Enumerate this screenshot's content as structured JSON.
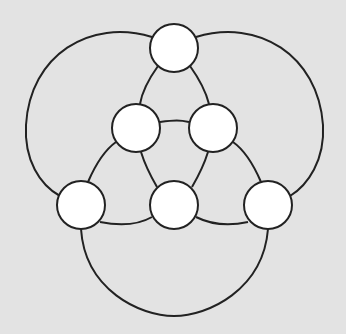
{
  "diagram": {
    "type": "graph",
    "background": "#e3e3e3",
    "stroke_color": "#222222",
    "node_fill": "#ffffff",
    "node_radius": 24,
    "nodes": [
      {
        "id": "top",
        "cx": 174,
        "cy": 48
      },
      {
        "id": "inner-left",
        "cx": 136,
        "cy": 128
      },
      {
        "id": "inner-right",
        "cx": 213,
        "cy": 128
      },
      {
        "id": "bottom-left",
        "cx": 81,
        "cy": 205
      },
      {
        "id": "bottom-middle",
        "cx": 174,
        "cy": 205
      },
      {
        "id": "bottom-right",
        "cx": 268,
        "cy": 205
      }
    ],
    "edges": [
      {
        "id": "outer-left",
        "d": "M 152 37 C 90 18, 30 55, 26 125 C 24 160, 40 185, 60 196"
      },
      {
        "id": "outer-right",
        "d": "M 196 37 C 258 18, 318 55, 323 125 C 325 160, 308 185, 290 196"
      },
      {
        "id": "outer-bottom",
        "d": "M 81 229 C 85 290, 140 316, 174 316 C 208 316, 263 290, 268 229"
      },
      {
        "id": "top-innerleft",
        "d": "M 158 66 C 148 80, 142 92, 140 104"
      },
      {
        "id": "top-innerright",
        "d": "M 190 66 C 200 80, 206 92, 209 104"
      },
      {
        "id": "innerleft-innerright",
        "d": "M 160 122 C 175 120, 180 120, 189 122"
      },
      {
        "id": "innerleft-bottomleft",
        "d": "M 116 142 C 102 152, 94 168, 88 182"
      },
      {
        "id": "innerright-bottomright",
        "d": "M 233 142 C 247 152, 255 168, 261 182"
      },
      {
        "id": "innerleft-bottommiddle",
        "d": "M 141 152 C 145 165, 150 175, 157 187"
      },
      {
        "id": "innerright-bottommiddle",
        "d": "M 208 152 C 204 165, 199 175, 192 187"
      },
      {
        "id": "bottomleft-bottommiddle",
        "d": "M 100 222 C 120 226, 138 225, 152 217"
      },
      {
        "id": "bottommiddle-bottomright",
        "d": "M 196 217 C 212 225, 230 226, 248 222"
      }
    ]
  }
}
